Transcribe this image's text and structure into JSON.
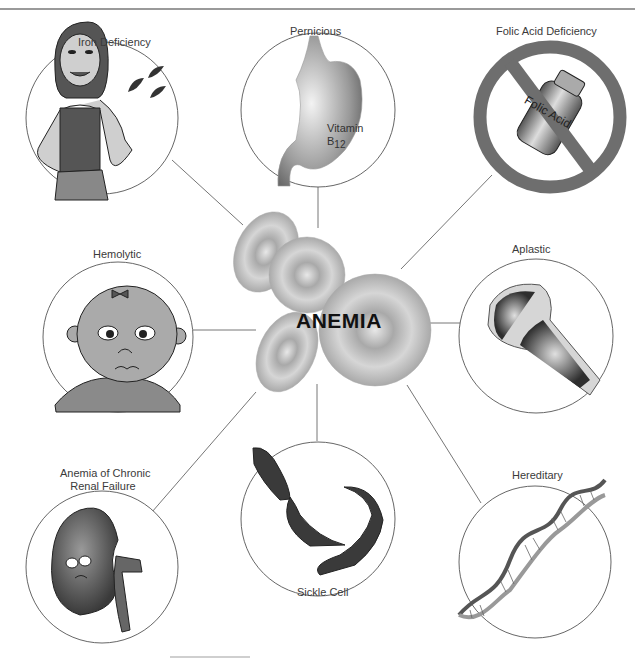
{
  "diagram": {
    "title": "ANEMIA",
    "center": {
      "label": "ANEMIA",
      "icon": "red-blood-cells"
    },
    "nodes": [
      {
        "id": "iron",
        "label": "Iron Deficiency",
        "icon": "woman-with-blood-drops"
      },
      {
        "id": "pernicious",
        "label": "Pernicious",
        "icon": "stomach",
        "inner_text": "Vitamin",
        "inner_text_b": "B",
        "inner_text_sub": "12"
      },
      {
        "id": "folic",
        "label": "Folic Acid Deficiency",
        "icon": "prohibited-folic-acid-bottle",
        "inner_text": "Folic Acid"
      },
      {
        "id": "hemolytic",
        "label": "Hemolytic",
        "icon": "sad-child-face"
      },
      {
        "id": "aplastic",
        "label": "Aplastic",
        "icon": "bone-marrow"
      },
      {
        "id": "renal",
        "label_line1": "Anemia of Chronic",
        "label_line2": "Renal Failure",
        "icon": "sad-kidney"
      },
      {
        "id": "sickle",
        "label": "Sickle Cell",
        "icon": "sickle-cells"
      },
      {
        "id": "hereditary",
        "label": "Hereditary",
        "icon": "dna-helix"
      }
    ],
    "colors": {
      "circle_stroke": "#555555",
      "connector": "#666666",
      "rbc_fill": "#bdbdbd",
      "dark_fill": "#3a3a3a",
      "prohibit_red_gray": "#7a7a7a"
    }
  }
}
